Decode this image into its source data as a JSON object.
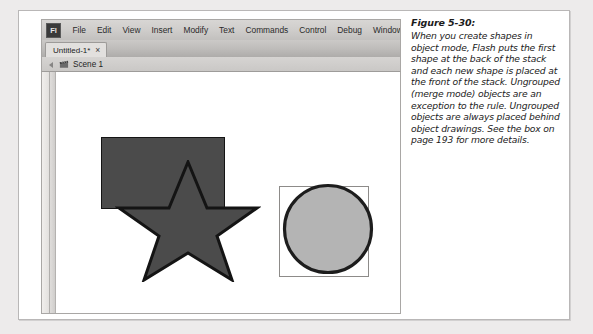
{
  "figure": {
    "title": "Figure 5-30:",
    "caption": "When you create shapes in object mode, Flash puts the first shape at the back of the stack and each new shape is placed at the front of the stack. Ungrouped (merge mode) objects are an exception to the rule. Ungrouped objects are always placed behind object drawings. See the box on page 193 for more details."
  },
  "app": {
    "logo_text": "Fl",
    "menus": [
      {
        "label": "File"
      },
      {
        "label": "Edit"
      },
      {
        "label": "View"
      },
      {
        "label": "Insert"
      },
      {
        "label": "Modify"
      },
      {
        "label": "Text"
      },
      {
        "label": "Commands"
      },
      {
        "label": "Control"
      },
      {
        "label": "Debug"
      },
      {
        "label": "Window"
      }
    ],
    "tab": {
      "label": "Untitled-1*",
      "close_glyph": "×"
    },
    "scene": {
      "label": "Scene 1"
    }
  },
  "stage": {
    "shapes": [
      {
        "name": "rectangle",
        "fill": "#4b4b4b",
        "stroke": "#141414"
      },
      {
        "name": "star",
        "fill": "#4b4b4b",
        "stroke": "#141414"
      },
      {
        "name": "circle",
        "fill": "#b4b4b4",
        "stroke": "#232323"
      }
    ],
    "selection_box": {
      "stroke": "#8d8b89"
    }
  },
  "colors": {
    "page_background": "#edebeb",
    "frame_background": "#ffffff",
    "chrome_gray": "#cfcdcb",
    "stage_white": "#ffffff"
  }
}
